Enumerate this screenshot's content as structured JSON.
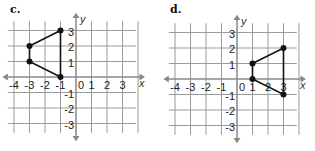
{
  "panels": [
    {
      "label": "c.",
      "origin_px": [
        76,
        77
      ],
      "unit_px": 15.5,
      "x_ticks": [
        "-4",
        "-3",
        "-2",
        "-1",
        "0",
        "1",
        "2",
        "3"
      ],
      "y_ticks": [
        "3",
        "2",
        "1",
        "-1",
        "-2",
        "-3"
      ],
      "x_axis_label": "x",
      "y_axis_label": "y",
      "vertices": [
        [
          -1,
          3
        ],
        [
          -3,
          2
        ],
        [
          -3,
          1
        ],
        [
          -1,
          0
        ]
      ]
    },
    {
      "label": "d.",
      "origin_px": [
        80,
        79
      ],
      "unit_px": 15.5,
      "x_ticks": [
        "-4",
        "-3",
        "-2",
        "-1",
        "0",
        "1",
        "2",
        "3"
      ],
      "y_ticks": [
        "3",
        "2",
        "1",
        "-1",
        "-2",
        "-3"
      ],
      "x_axis_label": "x",
      "y_axis_label": "y",
      "vertices": [
        [
          1,
          1
        ],
        [
          3,
          2
        ],
        [
          3,
          -1
        ],
        [
          1,
          0
        ]
      ]
    }
  ],
  "colors": {
    "grid": "#9a9a9a",
    "axis": "#888888",
    "shape": "#111111"
  }
}
